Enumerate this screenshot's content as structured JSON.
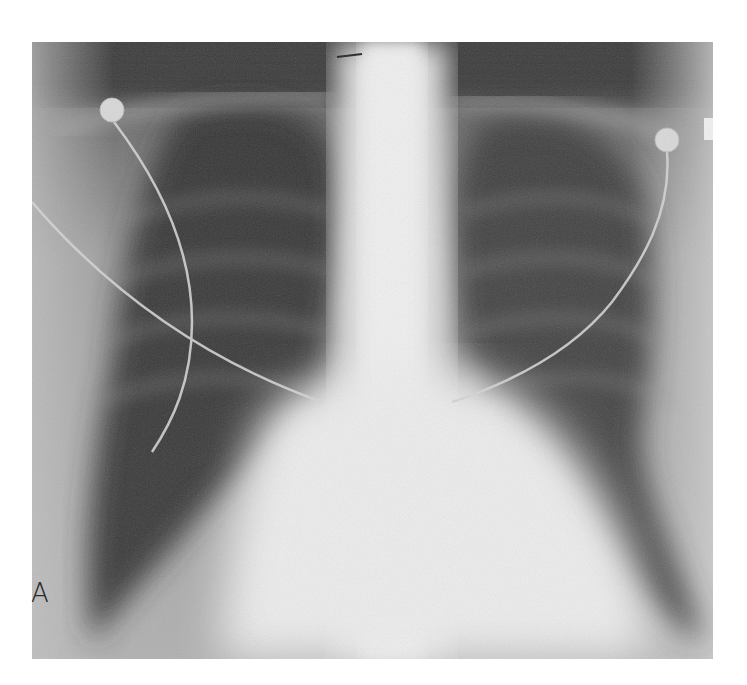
{
  "figure": {
    "panel_label": "A",
    "features": [
      "left-lung-field",
      "right-lung-field",
      "mediastinum",
      "heart-shadow",
      "spine",
      "ecg-electrode-left",
      "ecg-electrode-right",
      "ecg-lead-wires"
    ]
  }
}
